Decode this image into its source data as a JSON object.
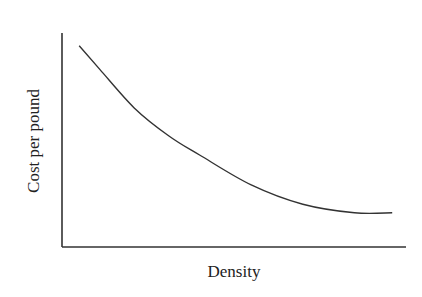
{
  "chart_data": {
    "type": "line",
    "title": "",
    "xlabel": "Density",
    "ylabel": "Cost per pound",
    "grid": false,
    "legend": null,
    "ticks": {
      "x": [],
      "y": []
    },
    "series": [
      {
        "name": "Cost per pound",
        "points_normalized": [
          {
            "x": 0.05,
            "y": 0.94
          },
          {
            "x": 0.11,
            "y": 0.83
          },
          {
            "x": 0.21,
            "y": 0.65
          },
          {
            "x": 0.31,
            "y": 0.52
          },
          {
            "x": 0.4,
            "y": 0.43
          },
          {
            "x": 0.55,
            "y": 0.29
          },
          {
            "x": 0.7,
            "y": 0.2
          },
          {
            "x": 0.85,
            "y": 0.16
          },
          {
            "x": 0.96,
            "y": 0.16
          }
        ]
      }
    ],
    "style": {
      "line_color": "#333333",
      "axis_color": "#333333"
    }
  }
}
